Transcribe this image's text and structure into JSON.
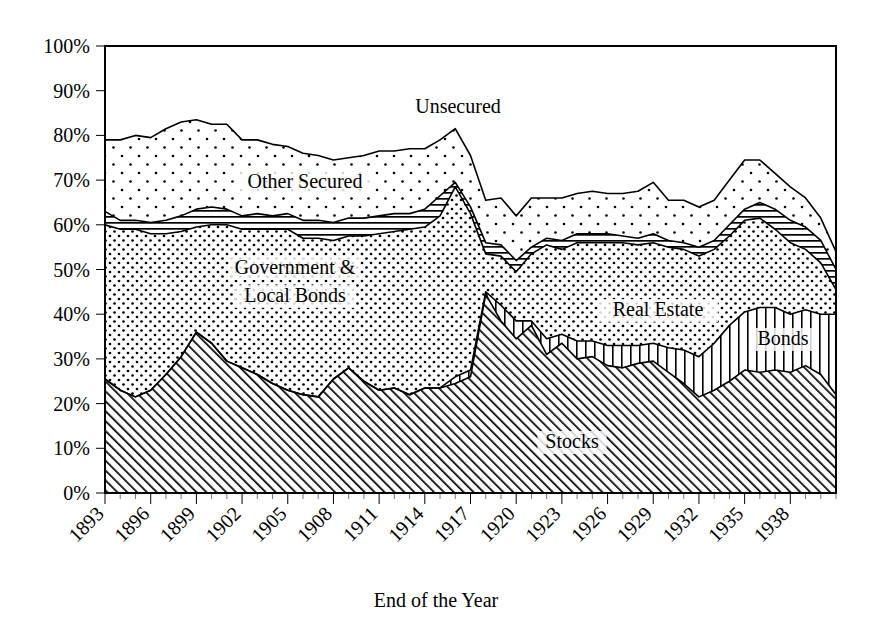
{
  "chart_data": {
    "type": "area",
    "stacked": true,
    "title": "",
    "xlabel": "End of the Year",
    "ylabel": "",
    "ylim": [
      0,
      100
    ],
    "ytick_labels": [
      "0%",
      "10%",
      "20%",
      "30%",
      "40%",
      "50%",
      "60%",
      "70%",
      "80%",
      "90%",
      "100%"
    ],
    "ytick_values": [
      0,
      10,
      20,
      30,
      40,
      50,
      60,
      70,
      80,
      90,
      100
    ],
    "xtick_labels": [
      "1893",
      "1896",
      "1899",
      "1902",
      "1905",
      "1908",
      "1911",
      "1914",
      "1917",
      "1920",
      "1923",
      "1926",
      "1929",
      "1932",
      "1935",
      "1938"
    ],
    "xtick_values": [
      1893,
      1896,
      1899,
      1902,
      1905,
      1908,
      1911,
      1914,
      1917,
      1920,
      1923,
      1926,
      1929,
      1932,
      1935,
      1938
    ],
    "xlim": [
      1893,
      1941
    ],
    "grid": false,
    "legend_position": "inline-annotations",
    "x": [
      1893,
      1894,
      1895,
      1896,
      1897,
      1898,
      1899,
      1900,
      1901,
      1902,
      1903,
      1904,
      1905,
      1906,
      1907,
      1908,
      1909,
      1910,
      1911,
      1912,
      1913,
      1914,
      1915,
      1916,
      1917,
      1918,
      1919,
      1920,
      1921,
      1922,
      1923,
      1924,
      1925,
      1926,
      1927,
      1928,
      1929,
      1930,
      1931,
      1932,
      1933,
      1934,
      1935,
      1936,
      1937,
      1938,
      1939,
      1940,
      1941
    ],
    "series": [
      {
        "name": "Stocks",
        "pattern": "diagonal-hatch",
        "values": [
          25.5,
          23.0,
          21.5,
          23.0,
          26.5,
          30.5,
          36.0,
          33.5,
          29.5,
          28.0,
          26.5,
          24.5,
          23.0,
          22.0,
          21.5,
          25.5,
          28.0,
          25.0,
          23.0,
          23.5,
          22.0,
          23.5,
          23.5,
          24.5,
          26.0,
          44.5,
          38.5,
          34.5,
          37.5,
          31.0,
          33.5,
          30.0,
          30.5,
          28.5,
          28.0,
          29.0,
          29.5,
          27.0,
          24.5,
          21.5,
          23.0,
          25.0,
          27.5,
          27.0,
          27.5,
          27.0,
          28.5,
          26.5,
          22.0
        ]
      },
      {
        "name": "Bonds",
        "pattern": "vertical-hatch",
        "values": [
          0.0,
          0.0,
          0.0,
          0.0,
          0.0,
          0.0,
          0.0,
          0.0,
          0.0,
          0.0,
          0.0,
          0.0,
          0.0,
          0.0,
          0.0,
          0.0,
          0.0,
          0.0,
          0.0,
          0.0,
          0.0,
          0.0,
          0.0,
          1.5,
          1.5,
          0.5,
          3.5,
          4.0,
          1.0,
          3.5,
          2.0,
          4.0,
          3.5,
          4.5,
          5.0,
          4.0,
          4.0,
          5.5,
          7.5,
          9.0,
          10.5,
          12.5,
          13.0,
          14.5,
          14.0,
          13.0,
          12.5,
          13.5,
          18.0
        ]
      },
      {
        "name": "Government & Local Bonds / Real Estate",
        "pattern": "coarse-dots",
        "values": [
          34.5,
          36.0,
          37.5,
          35.0,
          31.5,
          28.0,
          23.5,
          26.5,
          30.5,
          31.0,
          32.5,
          34.5,
          36.0,
          35.0,
          35.5,
          31.0,
          29.5,
          32.5,
          35.0,
          35.0,
          37.0,
          36.0,
          38.5,
          42.5,
          35.0,
          8.5,
          11.0,
          11.0,
          15.0,
          21.0,
          19.0,
          22.0,
          22.0,
          23.0,
          23.0,
          22.5,
          22.5,
          22.5,
          22.5,
          22.5,
          21.0,
          20.0,
          20.5,
          20.0,
          17.5,
          16.0,
          13.5,
          11.5,
          5.5
        ]
      },
      {
        "name": "Other Secured",
        "pattern": "horizontal-hatch",
        "values": [
          3.0,
          2.0,
          2.0,
          2.5,
          3.0,
          3.5,
          4.0,
          4.0,
          3.5,
          3.0,
          3.5,
          3.0,
          3.5,
          4.0,
          4.0,
          4.0,
          4.0,
          4.0,
          4.0,
          4.0,
          3.5,
          4.0,
          4.5,
          1.0,
          1.5,
          2.5,
          2.5,
          2.5,
          1.5,
          1.5,
          2.0,
          2.0,
          2.0,
          2.0,
          1.5,
          1.5,
          2.0,
          1.5,
          1.5,
          2.0,
          2.0,
          2.5,
          2.5,
          3.5,
          4.5,
          5.0,
          5.0,
          5.0,
          4.5
        ]
      },
      {
        "name": "Unsecured",
        "pattern": "fine-dots",
        "values": [
          16.0,
          18.0,
          19.0,
          19.0,
          20.5,
          21.0,
          20.0,
          18.5,
          19.0,
          17.0,
          16.5,
          16.0,
          15.0,
          15.0,
          14.5,
          14.0,
          13.5,
          14.0,
          14.5,
          14.0,
          14.5,
          13.5,
          12.5,
          12.0,
          11.5,
          9.5,
          10.5,
          10.0,
          11.0,
          9.0,
          9.5,
          9.0,
          9.5,
          9.0,
          9.5,
          10.5,
          11.5,
          9.0,
          9.5,
          9.0,
          9.0,
          10.0,
          11.0,
          9.5,
          8.0,
          7.5,
          6.5,
          5.0,
          4.0
        ]
      }
    ],
    "annotations": [
      {
        "text": "Unsecured",
        "x_px": 458,
        "y_px": 113
      },
      {
        "text": "Other Secured",
        "x_px": 305,
        "y_px": 188
      },
      {
        "text": "Government &",
        "x_px": 295,
        "y_px": 274
      },
      {
        "text": "Local Bonds",
        "x_px": 295,
        "y_px": 302
      },
      {
        "text": "Real Estate",
        "x_px": 658,
        "y_px": 316
      },
      {
        "text": "Bonds",
        "x_px": 783,
        "y_px": 345
      },
      {
        "text": "Stocks",
        "x_px": 572,
        "y_px": 448
      }
    ]
  },
  "colors": {
    "ink": "#000000",
    "paper": "#ffffff"
  }
}
